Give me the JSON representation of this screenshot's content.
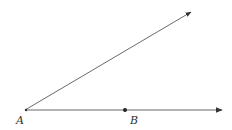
{
  "diagram": {
    "type": "geometry-angle",
    "colors": {
      "line": "#6b6b6b",
      "point": "#222222",
      "label": "#333333",
      "background": "#ffffff"
    },
    "vertex": {
      "label": "A",
      "x": 25,
      "y": 110
    },
    "rays": [
      {
        "name": "upper-ray",
        "from": [
          25,
          110
        ],
        "to": [
          191,
          12
        ]
      },
      {
        "name": "horizontal-ray",
        "from": [
          25,
          110
        ],
        "to": [
          222,
          110
        ]
      }
    ],
    "points": [
      {
        "label": "B",
        "x": 125,
        "y": 110
      }
    ],
    "labels": {
      "A": "A",
      "B": "B"
    }
  }
}
